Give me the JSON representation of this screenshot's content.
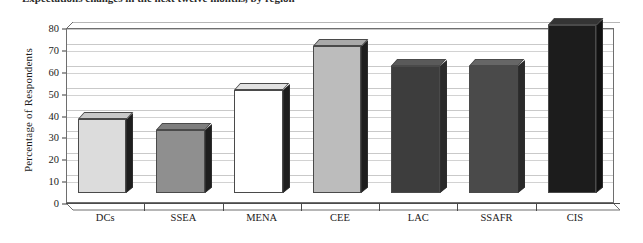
{
  "caption": {
    "text": "Expectations changes in the next twelve months, by region"
  },
  "chart_data": {
    "type": "bar",
    "title": "",
    "xlabel": "",
    "ylabel": "Percentage of Respondents",
    "categories": [
      "DCs",
      "SSEA",
      "MENA",
      "CEE",
      "LAC",
      "SSAFR",
      "CIS"
    ],
    "values": [
      34,
      29,
      47,
      67,
      58,
      58,
      77
    ],
    "ylim": [
      0,
      80
    ],
    "ytick_values": [
      0,
      10,
      20,
      30,
      40,
      50,
      60,
      70,
      80
    ],
    "grid": true,
    "legend": "none",
    "style": "3d-bars",
    "bar_colors": [
      "#dcdcdc",
      "#8f8f8f",
      "#ffffff",
      "#bcbcbc",
      "#3d3d3d",
      "#4a4a4a",
      "#1c1c1c"
    ],
    "bar_top_colors": [
      "#c8c8c8",
      "#7e7e7e",
      "#e2e2e2",
      "#a9a9a9",
      "#5a5a5a",
      "#666666",
      "#343434"
    ],
    "bar_side_colors": [
      "#1e1e1e",
      "#1e1e1e",
      "#1e1e1e",
      "#1e1e1e",
      "#2a2a2a",
      "#2a2a2a",
      "#111111"
    ]
  }
}
